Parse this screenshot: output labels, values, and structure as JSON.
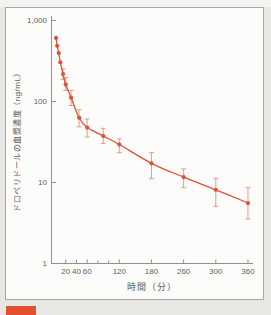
{
  "colors": {
    "accent": "#df5138",
    "error_bar": "#eb8f76",
    "axis": "#8f918d",
    "text": "#5c5c5c",
    "page_bg": "#e7e8e3",
    "top_strip": "#f3f3f1",
    "panel_bg": "#fcfcfa",
    "panel_border": "#a6a8a4",
    "caption_tab": "#e4502e"
  },
  "chart_data": {
    "type": "line",
    "title": "",
    "xlabel": "時間（分）",
    "ylabel": "ドロペリドールの血漿濃度（ng/mL）",
    "grid": false,
    "legend": null,
    "x_axis": {
      "scale": "linear",
      "range_min": 0,
      "range_max": 370,
      "tick_values": [
        20,
        40,
        60,
        120,
        180,
        240,
        300,
        360
      ],
      "tick_labels": [
        "20",
        "40",
        "60",
        "120",
        "180",
        "260",
        "300",
        "360"
      ],
      "minor_tick_values": [
        80,
        100
      ]
    },
    "y_axis": {
      "scale": "log",
      "range_min": 1,
      "range_max": 1000,
      "tick_values": [
        1000,
        100,
        10,
        1
      ],
      "tick_labels": [
        "1,000",
        "100",
        "10",
        "1"
      ]
    },
    "series": [
      {
        "name": "droperidol-plasma-concentration",
        "marker": "circle",
        "points": [
          {
            "t": 2,
            "c": 600,
            "lo": null,
            "hi": null
          },
          {
            "t": 4,
            "c": 480,
            "lo": null,
            "hi": null
          },
          {
            "t": 7,
            "c": 390,
            "lo": null,
            "hi": null
          },
          {
            "t": 10,
            "c": 300,
            "lo": null,
            "hi": null
          },
          {
            "t": 15,
            "c": 215,
            "lo": 185,
            "hi": 250
          },
          {
            "t": 20,
            "c": 160,
            "lo": 135,
            "hi": 195
          },
          {
            "t": 30,
            "c": 110,
            "lo": 88,
            "hi": 135
          },
          {
            "t": 45,
            "c": 62,
            "lo": 48,
            "hi": 78
          },
          {
            "t": 60,
            "c": 47,
            "lo": 36,
            "hi": 60
          },
          {
            "t": 90,
            "c": 37,
            "lo": 30,
            "hi": 46
          },
          {
            "t": 120,
            "c": 29,
            "lo": 23,
            "hi": 34
          },
          {
            "t": 180,
            "c": 17,
            "lo": 11,
            "hi": 23
          },
          {
            "t": 240,
            "c": 11.5,
            "lo": 8.5,
            "hi": 14.5
          },
          {
            "t": 300,
            "c": 8,
            "lo": 5,
            "hi": 11
          },
          {
            "t": 360,
            "c": 5.5,
            "lo": 3.5,
            "hi": 8.5
          }
        ]
      }
    ]
  }
}
